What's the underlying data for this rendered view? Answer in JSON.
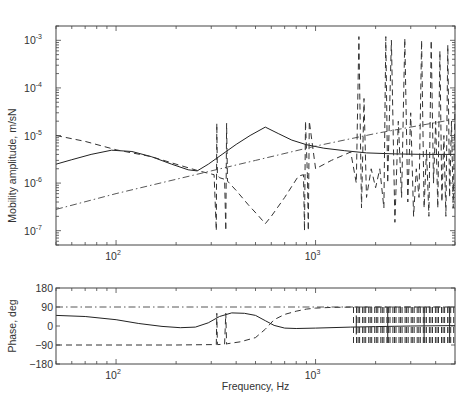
{
  "chart_data": [
    {
      "type": "line",
      "panel": "top",
      "title": "",
      "xlabel": "",
      "ylabel": "Mobility amplitude, m/sN",
      "xscale": "log",
      "yscale": "log",
      "xlim": [
        50,
        5000
      ],
      "ylim": [
        5e-08,
        0.002
      ],
      "grid": false,
      "xticks": [
        {
          "value": 100,
          "base": "10",
          "exp": "2"
        },
        {
          "value": 1000,
          "base": "10",
          "exp": "3"
        }
      ],
      "yticks": [
        {
          "value": 0.001,
          "base": "10",
          "exp": "-3"
        },
        {
          "value": 0.0001,
          "base": "10",
          "exp": "-4"
        },
        {
          "value": 1e-05,
          "base": "10",
          "exp": "-5"
        },
        {
          "value": 1e-06,
          "base": "10",
          "exp": "-6"
        },
        {
          "value": 1e-07,
          "base": "10",
          "exp": "-7"
        }
      ],
      "series": [
        {
          "name": "solid",
          "style": "solid",
          "x": [
            50,
            60,
            75,
            95,
            120,
            150,
            190,
            230,
            255,
            290,
            340,
            400,
            470,
            560,
            650,
            760,
            900,
            1100,
            1400,
            1800,
            2500,
            3500,
            5000
          ],
          "y": [
            2.5e-06,
            3.1e-06,
            4e-06,
            4.9e-06,
            4.6e-06,
            3.6e-06,
            2.5e-06,
            1.9e-06,
            1.8e-06,
            2.5e-06,
            4e-06,
            6.5e-06,
            1e-05,
            1.5e-05,
            1.1e-05,
            8e-06,
            6.4e-06,
            5.4e-06,
            4.8e-06,
            4.3e-06,
            4.1e-06,
            4e-06,
            4e-06
          ]
        },
        {
          "name": "dashed",
          "style": "dashed",
          "x": [
            50,
            70,
            100,
            150,
            200,
            260,
            310,
            318,
            320,
            322,
            330,
            350,
            355,
            358,
            362,
            400,
            460,
            520,
            560,
            600,
            700,
            820,
            870,
            880,
            890,
            910,
            920,
            930,
            1000,
            1200,
            1500,
            1600,
            1650,
            1700,
            1750,
            1800,
            1900,
            2000,
            2100,
            2200,
            2250,
            2300,
            2400,
            2500,
            2600,
            2700,
            2800,
            2900,
            3000,
            3100,
            3200,
            3300,
            3400,
            3500,
            3600,
            3700,
            3800,
            3900,
            4000,
            4100,
            4200,
            4300,
            4400,
            4500,
            4600,
            4700,
            4800,
            4900,
            5000
          ],
          "y": [
            1e-05,
            7.5e-06,
            5e-06,
            3.6e-06,
            2.5e-06,
            1.8e-06,
            1.5e-06,
            1e-07,
            1.8e-05,
            1.5e-06,
            1.3e-06,
            1.2e-06,
            1e-07,
            1.8e-05,
            1.1e-06,
            7e-07,
            3.5e-07,
            2e-07,
            1.4e-07,
            2e-07,
            5e-07,
            1.4e-06,
            1.5e-06,
            1e-07,
            2e-05,
            1.5e-06,
            1e-07,
            2e-05,
            2e-06,
            3e-06,
            4.5e-06,
            1e-06,
            0.0012,
            3e-07,
            6e-05,
            5e-07,
            2e-06,
            8e-07,
            2e-06,
            3e-07,
            0.0012,
            1e-06,
            0.001,
            1.5e-07,
            2e-05,
            5e-07,
            0.0011,
            4e-07,
            3e-05,
            2e-07,
            2e-06,
            5e-07,
            0.001,
            3e-07,
            5e-06,
            2e-07,
            0.001,
            1e-06,
            2e-05,
            3e-07,
            0.0006,
            4e-07,
            1e-05,
            2e-07,
            0.0008,
            5e-07,
            2e-05,
            3e-07,
            5e-05
          ]
        },
        {
          "name": "dash-dot",
          "style": "dashdot",
          "x": [
            50,
            100,
            200,
            300,
            500,
            1000,
            2000,
            3000,
            5000
          ],
          "y": [
            2.8e-07,
            6e-07,
            1.2e-06,
            1.8e-06,
            3e-06,
            6e-06,
            1.1e-05,
            1.5e-05,
            2.2e-05
          ]
        }
      ]
    },
    {
      "type": "line",
      "panel": "bottom",
      "title": "",
      "xlabel": "Frequency, Hz",
      "ylabel": "Phase, deg",
      "xscale": "log",
      "yscale": "linear",
      "xlim": [
        50,
        5000
      ],
      "ylim": [
        -180,
        180
      ],
      "grid": false,
      "xticks": [
        {
          "value": 100,
          "base": "10",
          "exp": "2"
        },
        {
          "value": 1000,
          "base": "10",
          "exp": "3"
        }
      ],
      "yticks": [
        {
          "value": 180,
          "label": "180"
        },
        {
          "value": 90,
          "label": "90"
        },
        {
          "value": 0,
          "label": "0"
        },
        {
          "value": -90,
          "label": "-90"
        },
        {
          "value": -180,
          "label": "-180"
        }
      ],
      "series": [
        {
          "name": "solid",
          "style": "solid",
          "x": [
            50,
            70,
            100,
            130,
            170,
            210,
            250,
            290,
            330,
            380,
            440,
            500,
            560,
            620,
            700,
            800,
            1000,
            1500,
            2000,
            3000,
            5000
          ],
          "y": [
            50,
            45,
            30,
            12,
            -2,
            -8,
            -5,
            15,
            45,
            62,
            60,
            50,
            25,
            3,
            -10,
            -12,
            -10,
            -5,
            -3,
            0,
            2
          ],
          "spikes": [
            {
              "x": 1600,
              "y": [
                -40,
                50
              ]
            },
            {
              "x": 2300,
              "y": [
                -80,
                90
              ]
            },
            {
              "x": 3500,
              "y": [
                -80,
                90
              ]
            },
            {
              "x": 4700,
              "y": [
                -80,
                90
              ]
            }
          ]
        },
        {
          "name": "dashed",
          "style": "dashed",
          "x": [
            50,
            100,
            200,
            300,
            318,
            320,
            322,
            350,
            355,
            358,
            362,
            420,
            500,
            560,
            620,
            700,
            800,
            900,
            1000,
            1200,
            1600,
            2000,
            5000
          ],
          "y": [
            -90,
            -90,
            -90,
            -88,
            -88,
            60,
            -88,
            -86,
            60,
            -86,
            -84,
            -75,
            -55,
            -15,
            30,
            55,
            70,
            80,
            85,
            88,
            90,
            90,
            90
          ],
          "burst_region": [
            1550,
            5000
          ]
        },
        {
          "name": "dash-dot",
          "style": "dashdot",
          "x": [
            50,
            5000
          ],
          "y": [
            90,
            90
          ]
        }
      ]
    }
  ]
}
